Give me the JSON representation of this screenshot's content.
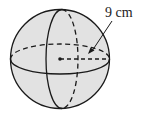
{
  "diagram": {
    "type": "sphere",
    "radius_label": "9 cm",
    "colors": {
      "fill": "#e2e2e2",
      "stroke": "#1a1a1a",
      "background": "#ffffff"
    }
  }
}
